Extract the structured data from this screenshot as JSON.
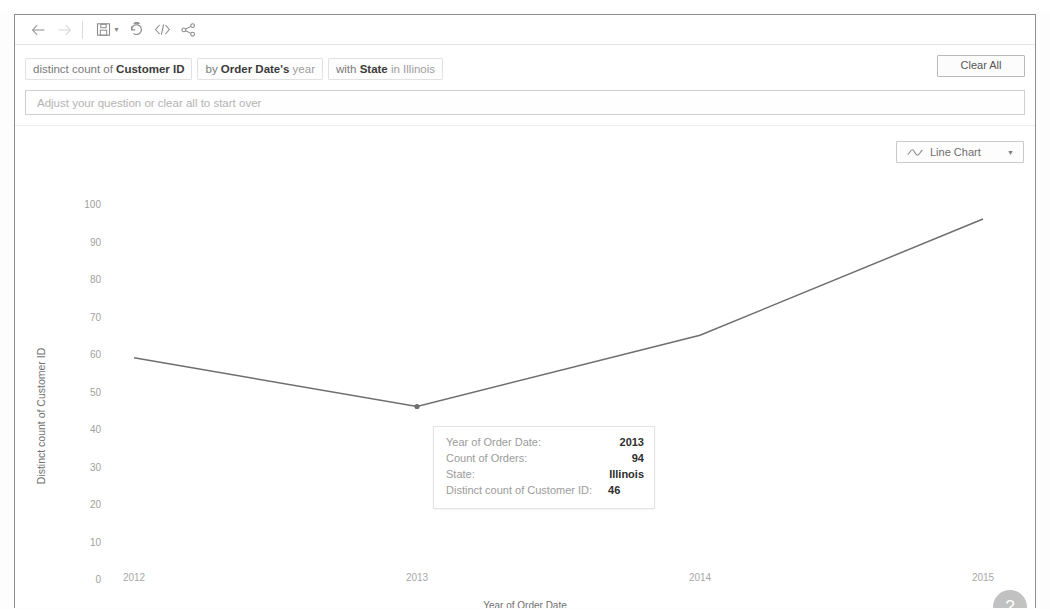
{
  "toolbar": {
    "back_label": "Back",
    "forward_label": "Forward",
    "save_label": "Save",
    "save_caret_label": "Save options",
    "revert_label": "Revert",
    "embed_label": "Embed code",
    "share_label": "Share"
  },
  "query": {
    "pills": [
      {
        "prefix": "distinct count of ",
        "bold": "Customer ID",
        "suffix": ""
      },
      {
        "prefix": "by ",
        "bold": "Order Date's",
        "suffix": " year"
      },
      {
        "prefix": "with ",
        "bold": "State",
        "suffix": " in Illinois"
      }
    ],
    "clear_all_label": "Clear All"
  },
  "question": {
    "value": "",
    "placeholder": "Adjust your question or clear all to start over"
  },
  "viz": {
    "chart_type_label": "Line Chart",
    "help_label": "?"
  },
  "tooltip": {
    "rows": [
      {
        "label": "Year of Order Date:",
        "value": "2013"
      },
      {
        "label": "Count of Orders:",
        "value": "94"
      },
      {
        "label": "State:",
        "value": "Illinois"
      },
      {
        "label": "Distinct count of Customer ID:",
        "value": "46"
      }
    ]
  },
  "chart_data": {
    "type": "line",
    "title": "",
    "xlabel": "Year of Order Date",
    "ylabel": "Distinct count of Customer ID",
    "categories": [
      "2012",
      "2013",
      "2014",
      "2015"
    ],
    "x": [
      2012,
      2013,
      2014,
      2015
    ],
    "values": [
      59,
      46,
      65,
      96
    ],
    "series": [
      {
        "name": "Distinct count of Customer ID",
        "values": [
          59,
          46,
          65,
          96
        ]
      }
    ],
    "ylim": [
      0,
      100
    ],
    "yticks": [
      100,
      90,
      80,
      70,
      60,
      50,
      40,
      30,
      20,
      10,
      0
    ],
    "xticks": [
      "2012",
      "2013",
      "2014",
      "2015"
    ],
    "grid": false,
    "legend": "none",
    "line_color": "#6e6e6e",
    "annotations": [
      {
        "x": "2013",
        "y": 46,
        "text": "Year of Order Date: 2013 | Count of Orders: 94 | State: Illinois | Distinct count of Customer ID: 46"
      }
    ]
  },
  "colors": {
    "line": "#6e6e6e",
    "frame_border": "#8d8d8d",
    "text_muted": "#9f9f9f"
  }
}
